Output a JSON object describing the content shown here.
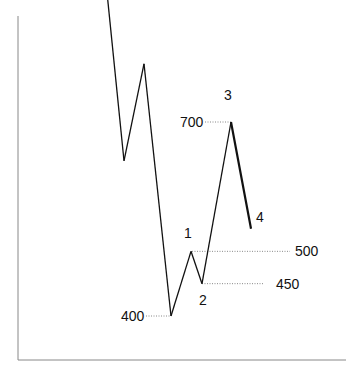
{
  "chart_data": {
    "type": "line",
    "title": "",
    "xlabel": "",
    "ylabel": "",
    "grid": false,
    "series": [
      {
        "name": "price-path",
        "points": [
          {
            "x": 0,
            "y": 1310
          },
          {
            "x": 1,
            "y": 1025
          },
          {
            "x": 2,
            "y": 1145
          },
          {
            "x": 3,
            "y": 640
          },
          {
            "x": 4,
            "y": 790
          },
          {
            "x": 5,
            "y": 400
          },
          {
            "x": 6,
            "y": 500
          },
          {
            "x": 7,
            "y": 450
          },
          {
            "x": 8,
            "y": 700
          },
          {
            "x": 9,
            "y": 535
          }
        ]
      }
    ],
    "levels": [
      {
        "label": "400",
        "value": 400
      },
      {
        "label": "500",
        "value": 500
      },
      {
        "label": "450",
        "value": 450
      },
      {
        "label": "700",
        "value": 700
      }
    ],
    "wave_labels": [
      {
        "label": "1",
        "point_index": 6
      },
      {
        "label": "2",
        "point_index": 7
      },
      {
        "label": "3",
        "point_index": 8
      },
      {
        "label": "4",
        "point_index": 9
      }
    ],
    "colors": {
      "line": "#111111",
      "guide": "#888888",
      "axis": "#888888"
    }
  }
}
